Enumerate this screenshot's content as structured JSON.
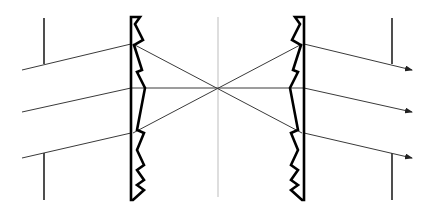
{
  "diagram": {
    "colors": {
      "background": "#ffffff",
      "ray": "#3a3a3a",
      "lens": "#000000",
      "stop": "#222222",
      "axis": "#c8c8c8"
    },
    "center_axis": {
      "x": 218,
      "y1": 17,
      "y2": 197
    },
    "focal_point": {
      "x": 218,
      "y": 88
    },
    "left_lens": {
      "flat_x": 131,
      "outline": "131,17 140,17 135,24 143,40 134,45 142,70 137,72 145,88 137,130 144,133 137,150 144,165 137,170 144,180 137,185 144,190 133,200 131,200"
    },
    "right_lens": {
      "flat_x": 304,
      "outline": "304,17 295,17 300,24 292,40 301,45 293,70 298,72 290,88 298,130 291,133 298,150 291,165 298,170 291,180 298,185 291,190 302,200 304,200"
    },
    "stops": [
      {
        "name": "left-top-stop",
        "x": 44,
        "y1": 18,
        "y2": 64
      },
      {
        "name": "left-bottom-stop",
        "x": 44,
        "y1": 153,
        "y2": 200
      },
      {
        "name": "right-top-stop",
        "x": 392,
        "y1": 18,
        "y2": 64
      },
      {
        "name": "right-bottom-stop",
        "x": 392,
        "y1": 153,
        "y2": 200
      }
    ],
    "incoming_rays": [
      {
        "x1": 22,
        "y1": 70,
        "x2": 131,
        "y2": 44
      },
      {
        "x1": 22,
        "y1": 112,
        "x2": 131,
        "y2": 88
      },
      {
        "x1": 22,
        "y1": 158,
        "x2": 131,
        "y2": 133
      }
    ],
    "converging_rays": [
      {
        "x1": 133,
        "y1": 44,
        "x2": 302,
        "y2": 133
      },
      {
        "x1": 133,
        "y1": 133,
        "x2": 302,
        "y2": 44
      },
      {
        "x1": 131,
        "y1": 88,
        "x2": 304,
        "y2": 88
      }
    ],
    "outgoing_rays": [
      {
        "x1": 304,
        "y1": 44,
        "x2": 412,
        "y2": 70
      },
      {
        "x1": 304,
        "y1": 88,
        "x2": 412,
        "y2": 112
      },
      {
        "x1": 304,
        "y1": 133,
        "x2": 412,
        "y2": 158
      }
    ]
  }
}
